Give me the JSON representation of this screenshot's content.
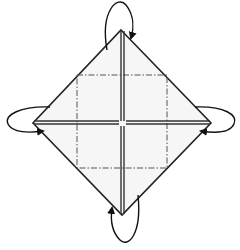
{
  "diagram": {
    "type": "origami-fold-step",
    "colors": {
      "paper": "#f6f6f6",
      "line": "#222222",
      "dash": "#555555"
    },
    "shape": {
      "top": [
        121,
        30
      ],
      "left": [
        33,
        123
      ],
      "right": [
        211,
        123
      ],
      "bottom": [
        122,
        215
      ]
    },
    "dashed_square": {
      "x1": 77,
      "y1": 75,
      "x2": 167,
      "y2": 168
    },
    "arrows": [
      {
        "name": "fold-top-behind",
        "position": "top"
      },
      {
        "name": "fold-left-behind",
        "position": "left"
      },
      {
        "name": "fold-right-behind",
        "position": "right"
      },
      {
        "name": "fold-bottom-behind",
        "position": "bottom"
      }
    ]
  }
}
